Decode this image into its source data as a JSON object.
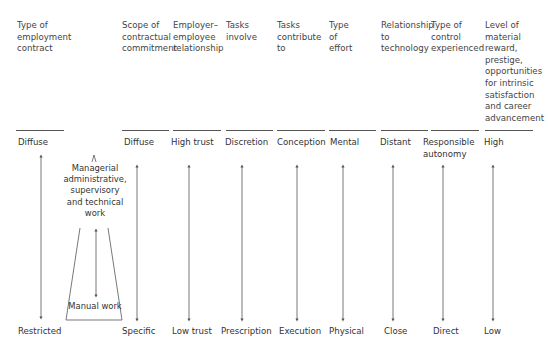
{
  "diagram": {
    "columns": [
      {
        "header": "Type of\nemployment\ncontract",
        "top": "Diffuse",
        "bottom": "Restricted"
      },
      {
        "header": "Scope of\ncontractual\ncommitment",
        "top": "Diffuse",
        "bottom": "Specific"
      },
      {
        "header": "Employer–\nemployee\nrelationship",
        "top": "High trust",
        "bottom": "Low trust"
      },
      {
        "header": "Tasks\ninvolve",
        "top": "Discretion",
        "bottom": "Prescription"
      },
      {
        "header": "Tasks\ncontribute\nto",
        "top": "Conception",
        "bottom": "Execution"
      },
      {
        "header": "Type\nof\neffort",
        "top": "Mental",
        "bottom": "Physical"
      },
      {
        "header": "Relationship\nto\ntechnology",
        "top": "Distant",
        "bottom": "Close"
      },
      {
        "header": "Type of\ncontrol\nexperienced",
        "top": "Responsible\nautonomy",
        "bottom": "Direct"
      },
      {
        "header": "Level of\nmaterial\nreward,\nprestige,\nopportunities\nfor intrinsic\nsatisfaction\nand career\nadvancement",
        "top": "High",
        "bottom": "Low"
      }
    ],
    "work_types": {
      "upper": "Managerial\nadministrative,\nsupervisory\nand technical\nwork",
      "lower": "Manual work"
    },
    "line_color": "#555555"
  }
}
